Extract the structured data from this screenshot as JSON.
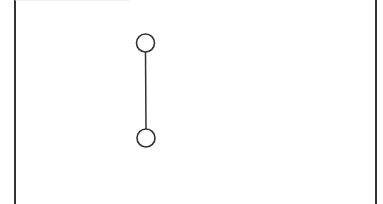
{
  "diagram": {
    "frame": {
      "left": 15,
      "right": 376,
      "top": 0,
      "bottom": 204,
      "stroke": "#333333",
      "stroke_width": 2
    },
    "nodes": [
      {
        "id": "top-node",
        "cx": 145.5,
        "cy": 43,
        "r": 9,
        "fill": "#ffffff",
        "stroke": "#333333"
      },
      {
        "id": "bottom-node",
        "cx": 146,
        "cy": 138,
        "r": 9,
        "fill": "#ffffff",
        "stroke": "#333333"
      }
    ],
    "edges": [
      {
        "from": "top-node",
        "to": "bottom-node",
        "stroke": "#333333",
        "stroke_width": 1.5
      }
    ]
  }
}
